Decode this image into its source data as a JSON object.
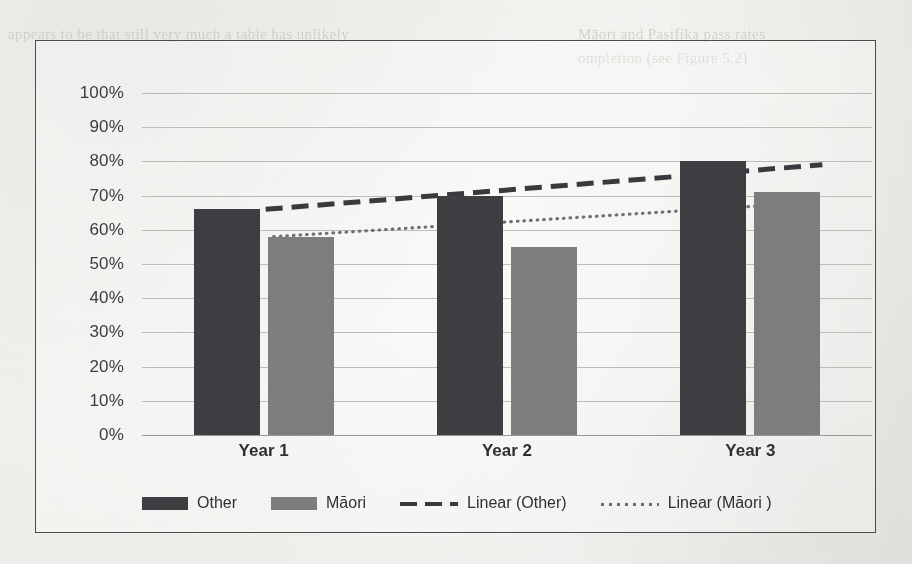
{
  "page": {
    "background_color": "#f3f2ef",
    "bleed_through_text": {
      "line1": "appears to be that still very much a table has unlikely",
      "line2": "Māori and Pasifika pass rates",
      "line3": "ompletion (see Figure 5.2)"
    }
  },
  "chart_frame": {
    "border_color": "#4b4b4b"
  },
  "colors": {
    "other_bar": "#3e3e42",
    "maori_bar": "#7d7d80",
    "trend_other": "#3a3a3e",
    "trend_maori": "#6f6f72",
    "gridline": "#b4b2ae"
  },
  "chart_data": {
    "type": "bar",
    "title": "",
    "xlabel": "",
    "ylabel": "",
    "categories": [
      "Year 1",
      "Year 2",
      "Year 3"
    ],
    "ylim": [
      0,
      100
    ],
    "yticks": [
      0,
      10,
      20,
      30,
      40,
      50,
      60,
      70,
      80,
      90,
      100
    ],
    "ytick_labels": [
      "0%",
      "10%",
      "20%",
      "30%",
      "40%",
      "50%",
      "60%",
      "70%",
      "80%",
      "90%",
      "100%"
    ],
    "grid": true,
    "legend_position": "bottom",
    "series": [
      {
        "name": "Other",
        "kind": "bar",
        "color": "#3e3e42",
        "values": [
          66,
          70,
          80
        ]
      },
      {
        "name": "Māori",
        "kind": "bar",
        "color": "#7d7d80",
        "values": [
          58,
          55,
          71
        ]
      },
      {
        "name": "Linear (Other)",
        "kind": "trendline",
        "style": "dashed",
        "color": "#3a3a3e",
        "endpoints": [
          66,
          79
        ]
      },
      {
        "name": "Linear (Māori )",
        "kind": "trendline",
        "style": "dotted",
        "color": "#6f6f72",
        "endpoints": [
          58,
          67
        ]
      }
    ]
  },
  "legend": {
    "items": [
      {
        "label": "Other",
        "marker": "bar-dark"
      },
      {
        "label": "Māori",
        "marker": "bar-gray"
      },
      {
        "label": "Linear (Other)",
        "marker": "dashed-line"
      },
      {
        "label": "Linear (Māori )",
        "marker": "dotted-line"
      }
    ]
  }
}
